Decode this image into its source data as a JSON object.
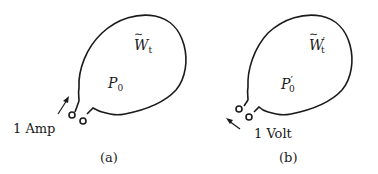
{
  "panels": [
    {
      "id": "a",
      "caption": "(a)",
      "source_label": "1 Amp",
      "region_symbol": "W",
      "region_subscript": "t",
      "region_prime": "",
      "port_symbol": "P",
      "port_subscript": "0",
      "port_prime": ""
    },
    {
      "id": "b",
      "caption": "(b)",
      "source_label": "1 Volt",
      "region_symbol": "W",
      "region_subscript": "t",
      "region_prime": "′",
      "port_symbol": "P",
      "port_subscript": "0",
      "port_prime": "′"
    }
  ],
  "colors": {
    "stroke": "#1a1a1a",
    "background": "#ffffff"
  }
}
